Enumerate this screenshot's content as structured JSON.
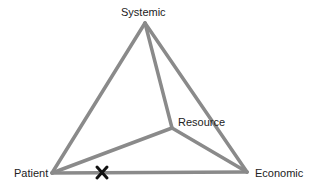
{
  "labels": {
    "top": "Systemic",
    "inner": "Resource",
    "left": "Patient",
    "right": "Economic"
  },
  "marker": {
    "symbol": "✕",
    "position": "on Patient–Economic edge"
  },
  "colors": {
    "edge": "#8a8a8a",
    "marker": "#111111",
    "text": "#222222"
  }
}
